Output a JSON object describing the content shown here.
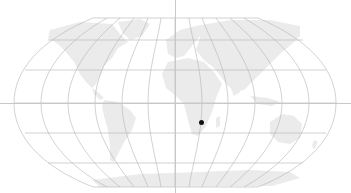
{
  "map": {
    "projection": "robinson",
    "background": "#ffffff",
    "land_color": "#ebebeb",
    "graticule_color": "#b4b4b4",
    "crosshair_color": "#c8c8c8",
    "crosshair": {
      "x": 175,
      "y": 103
    },
    "marker": {
      "x": 201,
      "y": 122,
      "color": "#111111",
      "label": ""
    }
  }
}
